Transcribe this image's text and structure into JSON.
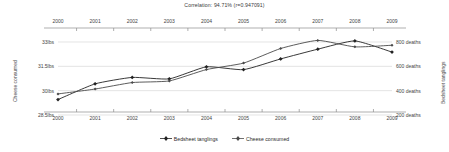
{
  "chart_data": {
    "type": "line",
    "title": "Correlation: 94.71% (r=0.947091)",
    "x": [
      2000,
      2001,
      2002,
      2003,
      2004,
      2005,
      2006,
      2007,
      2008,
      2009
    ],
    "categories": [
      "2000",
      "2001",
      "2002",
      "2003",
      "2004",
      "2005",
      "2006",
      "2007",
      "2008",
      "2009"
    ],
    "series": [
      {
        "name": "Bedsheet tanglings",
        "axis": "right",
        "unit": "deaths",
        "values": [
          327,
          456,
          509,
          497,
          596,
          573,
          661,
          741,
          809,
          717
        ]
      },
      {
        "name": "Cheese consumed",
        "axis": "left",
        "unit": "lbs",
        "values": [
          29.8,
          30.1,
          30.5,
          30.6,
          31.3,
          31.7,
          32.6,
          33.1,
          32.7,
          32.8
        ]
      }
    ],
    "xlabel": "",
    "ylabel": "Cheese consumed",
    "y2label": "Bedsheet tanglings",
    "ylim": [
      28.5,
      33.0
    ],
    "y2lim": [
      200,
      800
    ],
    "grid": true,
    "legend_position": "bottom",
    "axes": {
      "y_left": {
        "title": "Cheese consumed",
        "ticks": [
          "33lbs",
          "31.5lbs",
          "30lbs",
          "28.5lbs"
        ],
        "tick_values": [
          33,
          31.5,
          30,
          28.5
        ]
      },
      "y_right": {
        "title": "Bedsheet tanglings",
        "ticks": [
          "800 deaths",
          "600 deaths",
          "400 deaths",
          "200 deaths"
        ],
        "tick_values": [
          800,
          600,
          400,
          200
        ]
      },
      "x_bottom": {
        "ticks": [
          "2000",
          "2001",
          "2002",
          "2003",
          "2004",
          "2005",
          "2006",
          "2007",
          "2008",
          "2009"
        ]
      },
      "x_top": {
        "ticks": [
          "2000",
          "2001",
          "2002",
          "2003",
          "2004",
          "2005",
          "2006",
          "2007",
          "2008",
          "2009"
        ]
      }
    },
    "colors": {
      "series_1": "#222222",
      "series_2": "#4a4a4a",
      "grid": "#d8d8d8",
      "axis": "#8c8c8c",
      "text": "#3a3a3a",
      "background": "#ffffff"
    }
  },
  "legend": {
    "items": [
      {
        "label": "Bedsheet tanglings"
      },
      {
        "label": "Cheese consumed"
      }
    ]
  }
}
